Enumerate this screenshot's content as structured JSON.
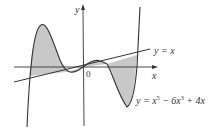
{
  "figure": {
    "axis_labels": {
      "y": "y",
      "x": "x",
      "origin": "0"
    },
    "line_label": "y = x",
    "curve_label": "y = x⁵ − 6x³ + 4x",
    "curve_label_parts": {
      "prefix": "y = x",
      "exp1": "5",
      "mid": " − 6x",
      "exp2": "3",
      "suffix": " + 4x"
    },
    "colors": {
      "stroke": "#333333",
      "shade": "#c8c8c8",
      "background": "#ffffff"
    }
  }
}
